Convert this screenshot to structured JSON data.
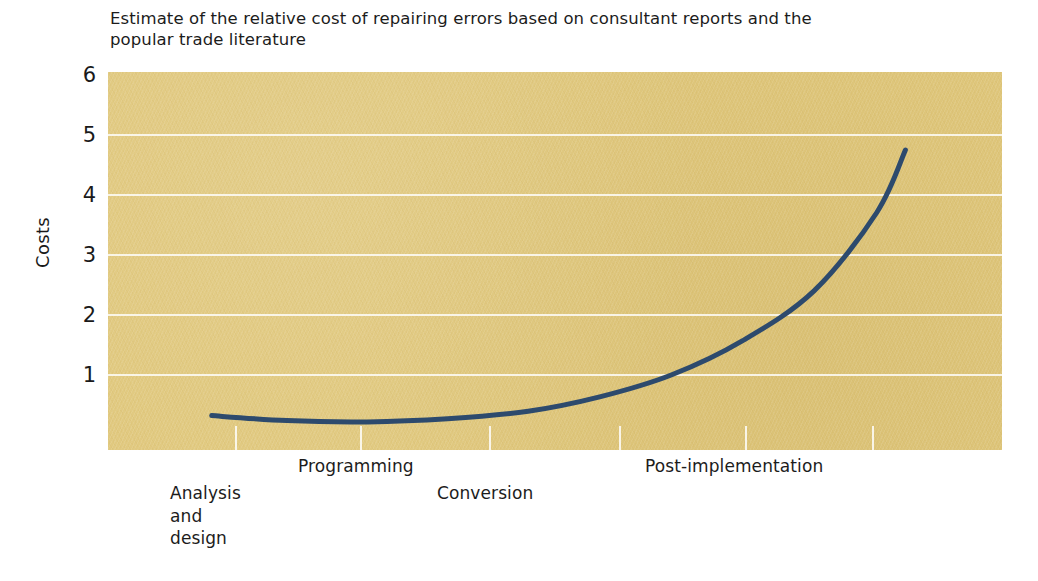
{
  "caption": {
    "line1": "Estimate of the relative cost of repairing errors based on consultant reports and the",
    "line2": "popular trade literature"
  },
  "axes": {
    "y_title": "Costs",
    "y_ticks": [
      "6",
      "5",
      "4",
      "3",
      "2",
      "1"
    ],
    "x_labels": [
      "Analysis\nand\ndesign",
      "Programming",
      "Conversion",
      "Post-implementation"
    ]
  },
  "colors": {
    "plot_background": "#e0c87d",
    "gridline": "#ffffff",
    "curve": "#2d4a6d",
    "text": "#1c1c1c",
    "page_background": "#ffffff"
  },
  "chart_data": {
    "type": "line",
    "title": "Estimate of the relative cost of repairing errors based on consultant reports and the popular trade literature",
    "xlabel": "",
    "ylabel": "Costs",
    "ylim": [
      0,
      6
    ],
    "yticks": [
      1,
      2,
      3,
      4,
      5,
      6
    ],
    "grid": true,
    "legend": false,
    "xtick_labels": [
      "Analysis and design",
      "Programming",
      "Conversion",
      "Post-implementation"
    ],
    "x_stage_positions": [
      0.14,
      0.42,
      0.6,
      0.85
    ],
    "series": [
      {
        "name": "Relative cost of repairing errors",
        "x": [
          0.116,
          0.2,
          0.29,
          0.38,
          0.47,
          0.55,
          0.63,
          0.71,
          0.79,
          0.86,
          0.892
        ],
        "y": [
          0.55,
          0.47,
          0.45,
          0.5,
          0.62,
          0.85,
          1.2,
          1.75,
          2.55,
          3.8,
          4.8
        ]
      }
    ],
    "annotations": [
      "Curve is nearly flat through analysis/design and programming, then rises steeply through conversion into post-implementation",
      "Ends at a relative cost of approximately 4.8"
    ]
  },
  "curve_path": "M 104 345 C 150 351, 205 353, 260 350 C 320 347, 375 338, 430 322 C 490 304, 540 281, 590 250 C 645 215, 690 175, 730 130 C 760 98, 780 90, 797 78"
}
